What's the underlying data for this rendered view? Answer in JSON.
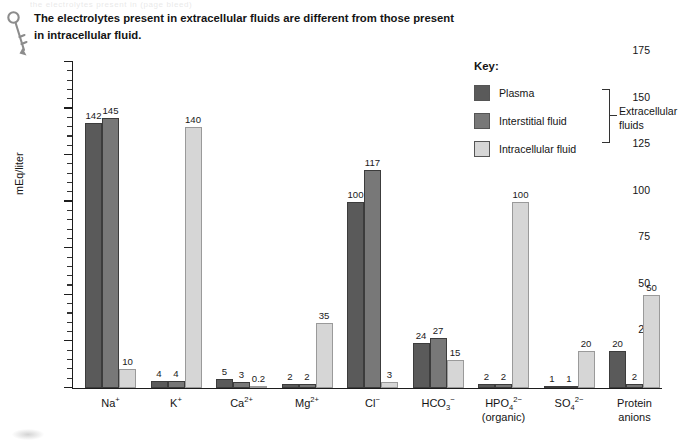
{
  "page": {
    "ghost_text": "the electrolytes present in (page bleed)",
    "caption": "The electrolytes present in extracellular fluids are different from those present in intracellular fluid.",
    "key_icon_name": "key-icon"
  },
  "legend": {
    "title": "Key:",
    "items": [
      {
        "label": "Plasma",
        "color": "#5a5a5a"
      },
      {
        "label": "Interstitial fluid",
        "color": "#787878"
      },
      {
        "label": "Intracellular fluid",
        "color": "#d6d6d6"
      }
    ],
    "bracket_label": "Extracellular fluids"
  },
  "chart_data": {
    "type": "bar",
    "title": "",
    "xlabel": "",
    "ylabel": "mEq/liter",
    "ylim": [
      0,
      175
    ],
    "yticks": [
      0,
      25,
      50,
      75,
      100,
      125,
      150,
      175
    ],
    "ytick_minor_step": 5,
    "grid": false,
    "legend_position": "top-right",
    "categories": [
      "Na+",
      "K+",
      "Ca2+",
      "Mg2+",
      "Cl-",
      "HCO3-",
      "HPO4 2- (organic)",
      "SO4 2-",
      "Protein anions"
    ],
    "category_labels_html": [
      "Na<sup>+</sup>",
      "K<sup>+</sup>",
      "Ca<sup>2+</sup>",
      "Mg<sup>2+</sup>",
      "Cl<sup>−</sup>",
      "HCO<sub>3</sub><sup>−</sup>",
      "HPO<sub>4</sub><sup>2−</sup><br>(organic)",
      "SO<sub>4</sub><sup>2−</sup>",
      "Protein<br>anions"
    ],
    "series": [
      {
        "name": "Plasma",
        "color": "#5a5a5a",
        "values": [
          142,
          4,
          5,
          2,
          100,
          24,
          2,
          1,
          20
        ],
        "labels": [
          "142",
          "4",
          "5",
          "2",
          "100",
          "24",
          "2",
          "1",
          "20"
        ]
      },
      {
        "name": "Interstitial fluid",
        "color": "#787878",
        "values": [
          145,
          4,
          3,
          2,
          117,
          27,
          2,
          1,
          2
        ],
        "labels": [
          "145",
          "4",
          "3",
          "2",
          "117",
          "27",
          "2",
          "1",
          "2"
        ]
      },
      {
        "name": "Intracellular fluid",
        "color": "#d6d6d6",
        "values": [
          10,
          140,
          0.2,
          35,
          3,
          15,
          100,
          20,
          50
        ],
        "labels": [
          "10",
          "140",
          "0.2",
          "35",
          "3",
          "15",
          "100",
          "20",
          "50"
        ]
      }
    ]
  }
}
